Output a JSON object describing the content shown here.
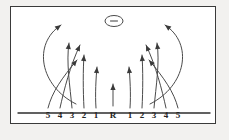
{
  "figure": {
    "background_color": "#f2f1ef",
    "panel_color": "#ffffff",
    "border_color": "#3a3a3a",
    "ink_color": "#4a4a4a"
  },
  "axis": {
    "name": "horizontal-scale-axis",
    "y": 113,
    "x_start": 18,
    "x_end": 210,
    "center_label": "R",
    "labels": [
      "5",
      "4",
      "3",
      "2",
      "1",
      "R",
      "1",
      "2",
      "3",
      "4",
      "5"
    ],
    "label_y": 116,
    "tick_positions": [
      48,
      60,
      72,
      84,
      96,
      113,
      130,
      142,
      154,
      166,
      178
    ]
  },
  "marker": {
    "name": "oval-marker",
    "cx": 114,
    "cy": 21,
    "rx": 9,
    "ry": 5.5,
    "dash_label": "-"
  },
  "arrows": [
    {
      "id": "arrow-left-5",
      "origin_label": "5",
      "origin_x": 48,
      "tip_x": 78,
      "tip_y": 57,
      "kind": "crossing-right",
      "path": "M 48 108 C 52 92, 62 78, 77 60"
    },
    {
      "id": "arrow-left-4",
      "origin_label": "4",
      "origin_x": 60,
      "tip_x": 81,
      "tip_y": 42,
      "kind": "crossing-right",
      "path": "M 60 108 C 64 90, 70 66, 80 45"
    },
    {
      "id": "arrow-left-3",
      "origin_label": "3",
      "origin_x": 72,
      "tip_x": 70,
      "tip_y": 40,
      "kind": "curved-up",
      "path": "M 72 108 C 70 86, 66 62, 69 43"
    },
    {
      "id": "arrow-left-2",
      "origin_label": "2",
      "origin_x": 84,
      "tip_x": 84,
      "tip_y": 52,
      "kind": "near-vertical",
      "path": "M 84 108 C 83 90, 83 70, 84 55"
    },
    {
      "id": "arrow-left-1",
      "origin_label": "1",
      "origin_x": 96,
      "tip_x": 97,
      "tip_y": 64,
      "kind": "near-vertical",
      "path": "M 96 108 C 95 94, 96 78, 97 67"
    },
    {
      "id": "arrow-center-R",
      "origin_label": "R",
      "origin_x": 113,
      "tip_x": 113,
      "tip_y": 81,
      "kind": "vertical",
      "path": "M 113 106 L 113 84"
    },
    {
      "id": "arrow-right-1",
      "origin_label": "1",
      "origin_x": 130,
      "tip_x": 129,
      "tip_y": 64,
      "kind": "near-vertical",
      "path": "M 130 108 C 131 94, 130 78, 129 67"
    },
    {
      "id": "arrow-right-2",
      "origin_label": "2",
      "origin_x": 142,
      "tip_x": 142,
      "tip_y": 52,
      "kind": "near-vertical",
      "path": "M 142 108 C 143 90, 143 70, 142 55"
    },
    {
      "id": "arrow-right-3",
      "origin_label": "3",
      "origin_x": 154,
      "tip_x": 156,
      "tip_y": 40,
      "kind": "curved-up",
      "path": "M 154 108 C 156 86, 160 62, 157 43"
    },
    {
      "id": "arrow-right-4",
      "origin_label": "4",
      "origin_x": 166,
      "tip_x": 145,
      "tip_y": 42,
      "kind": "crossing-left",
      "path": "M 166 108 C 162 90, 156 66, 146 45"
    },
    {
      "id": "arrow-right-5",
      "origin_label": "5",
      "origin_x": 178,
      "tip_x": 148,
      "tip_y": 57,
      "kind": "crossing-left",
      "path": "M 178 108 C 174 92, 164 78, 149 60"
    },
    {
      "id": "arrow-sweep-left",
      "origin_label": "3",
      "origin_x": 72,
      "tip_x": 62,
      "tip_y": 22,
      "kind": "wide-sweep",
      "path": "M 76 104 C 40 86, 32 44, 61 25"
    },
    {
      "id": "arrow-sweep-right",
      "origin_label": "3",
      "origin_x": 154,
      "tip_x": 164,
      "tip_y": 22,
      "kind": "wide-sweep",
      "path": "M 150 104 C 186 86, 194 44, 165 25"
    }
  ]
}
